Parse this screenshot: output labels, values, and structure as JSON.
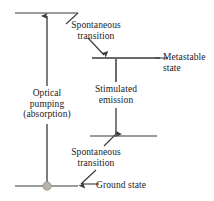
{
  "figure": {
    "type": "energy-level-diagram",
    "background_color": "#ffffff",
    "line_color": "#3a3a3a",
    "text_color": "#1b1b1b",
    "marker_color": "#b8b2aa",
    "width": 214,
    "height": 201
  },
  "labels": {
    "spontaneous_top_line1": "Spontaneous",
    "spontaneous_top_line2": "transition",
    "metastable_line1": "Metastable",
    "metastable_line2": "state",
    "stimulated_line1": "Stimulated",
    "stimulated_line2": "emission",
    "optical_line1": "Optical",
    "optical_line2": "pumping",
    "optical_line3": "(absorption)",
    "spontaneous_bot_line1": "Spontaneous",
    "spontaneous_bot_line2": "transition",
    "ground_state": "Ground state"
  },
  "levels": [
    {
      "name": "pump-level",
      "y": 13,
      "x1": 15,
      "x2": 78
    },
    {
      "name": "metastable-level",
      "y": 58,
      "x1": 92,
      "x2": 160
    },
    {
      "name": "lower-laser-level",
      "y": 136,
      "x1": 90,
      "x2": 157
    },
    {
      "name": "ground-level",
      "y": 186,
      "x1": 15,
      "x2": 78
    }
  ],
  "transitions": [
    {
      "name": "optical-pumping",
      "direction": "up",
      "x": 47,
      "from_y": 186,
      "to_y": 15
    },
    {
      "name": "spontaneous-transition-upper",
      "direction": "diagonal-down-right",
      "from": [
        78,
        13
      ],
      "to": [
        104,
        56
      ]
    },
    {
      "name": "stimulated-emission",
      "direction": "down",
      "x": 116,
      "from_y": 58,
      "to_y": 135
    },
    {
      "name": "spontaneous-transition-lower",
      "direction": "diagonal-down-left",
      "from": [
        118,
        133
      ],
      "to": [
        82,
        183
      ]
    }
  ]
}
